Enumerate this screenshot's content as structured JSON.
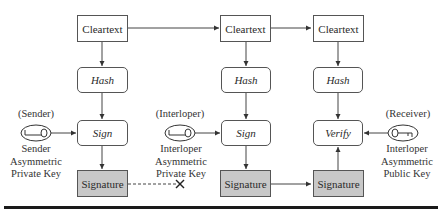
{
  "diagram": {
    "title": "",
    "columns": [
      {
        "id": "sender",
        "cleartext": "Cleartext",
        "hash": "Hash",
        "operation": "Sign",
        "output": "Signature",
        "key": {
          "role": "(Sender)",
          "caption": [
            "Sender",
            "Asymmetric",
            "Private Key"
          ],
          "icon": "key-icon"
        }
      },
      {
        "id": "interloper",
        "cleartext": "Cleartext",
        "hash": "Hash",
        "operation": "Sign",
        "output": "Signature",
        "key": {
          "role": "(Interloper)",
          "caption": [
            "Interloper",
            "Asymmetric",
            "Private Key"
          ],
          "icon": "key-icon"
        }
      },
      {
        "id": "receiver",
        "cleartext": "Cleartext",
        "hash": "Hash",
        "operation": "Verify",
        "output": "Signature",
        "key": {
          "role": "(Receiver)",
          "caption": [
            "Interloper",
            "Asymmetric",
            "Public Key"
          ],
          "icon": "key-icon"
        }
      }
    ],
    "connections": [
      {
        "from": "sender.cleartext",
        "to": "interloper.cleartext",
        "style": "solid"
      },
      {
        "from": "interloper.cleartext",
        "to": "receiver.cleartext",
        "style": "solid"
      },
      {
        "from": "sender.signature",
        "to": "blocked",
        "style": "dashed",
        "end": "x-mark"
      },
      {
        "from": "interloper.signature",
        "to": "receiver.signature",
        "style": "solid"
      }
    ],
    "colors": {
      "shaded_box": "#c8c8c8",
      "stroke": "#555555",
      "rule": "#1a1a1a"
    }
  }
}
